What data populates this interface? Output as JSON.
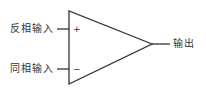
{
  "diagram": {
    "title": "",
    "type": "op-amp symbol",
    "inputs": [
      {
        "label": "反相输入",
        "sign": "+"
      },
      {
        "label": "同相输入",
        "sign": "−"
      }
    ],
    "output": {
      "label": "输出"
    },
    "colors": {
      "stroke": "#333333",
      "background": "#ffffff"
    }
  }
}
